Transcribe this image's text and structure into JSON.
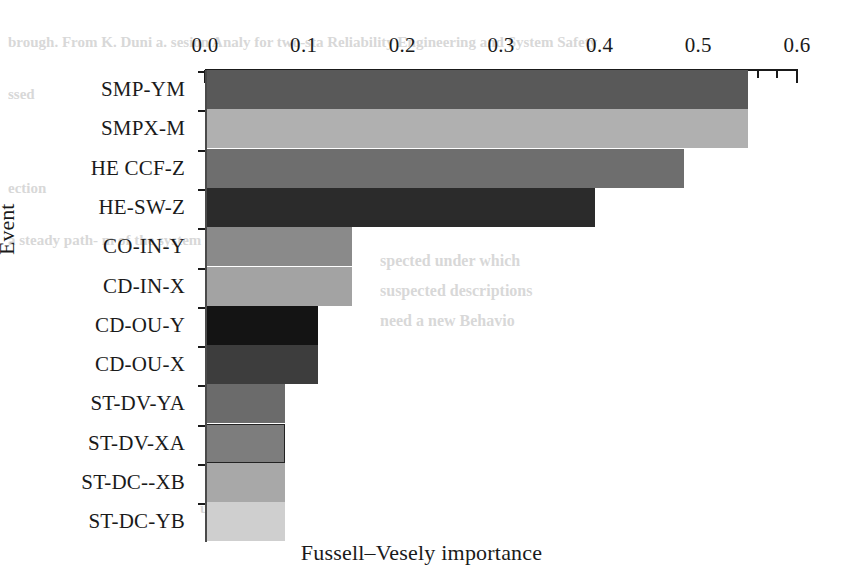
{
  "chart_data": {
    "type": "bar",
    "orientation": "horizontal",
    "title": "",
    "xlabel": "Fussell–Vesely importance",
    "ylabel": "Event",
    "categories": [
      "SMP-YM",
      "SMPX-M",
      "HE CCF-Z",
      "HE-SW-Z",
      "CO-IN-Y",
      "CD-IN-X",
      "CD-OU-Y",
      "CD-OU-X",
      "ST-DV-YA",
      "ST-DV-XA",
      "ST-DC--XB",
      "ST-DC-YB"
    ],
    "values": [
      0.55,
      0.55,
      0.485,
      0.395,
      0.149,
      0.149,
      0.115,
      0.115,
      0.081,
      0.081,
      0.081,
      0.081
    ],
    "bar_colors": [
      "#595959",
      "#b0b0b0",
      "#6e6e6e",
      "#2b2b2b",
      "#8a8a8a",
      "#a3a3a3",
      "#141414",
      "#3d3d3d",
      "#6b6b6b",
      "#7d7d7d",
      "#a8a8a8",
      "#cfcfcf"
    ],
    "xlim": [
      0.0,
      0.6
    ],
    "xticks": [
      0.0,
      0.1,
      0.2,
      0.3,
      0.4,
      0.5,
      0.6
    ],
    "xtick_labels": [
      "0.0",
      "0.1",
      "0.2",
      "0.3",
      "0.4",
      "0.5",
      "0.6"
    ],
    "minor_tick_step": 0.02,
    "grid": false,
    "legend": null,
    "legend_position": "none"
  },
  "axes": {
    "x_title": "Fussell–Vesely importance",
    "y_title": "Event"
  },
  "background_text": [
    "brough. From K. Duni   a.  sesion Analy  for two-sta   Reliability Engineering and System Safety",
    "ssed",
    "   ection",
    "Hessioan",
    "underlying",
    "a steady   path-   m of the system path   the",
    "    spected under which",
    "    suspected descriptions",
    "need a new  Behavio",
    "unknown"
  ]
}
